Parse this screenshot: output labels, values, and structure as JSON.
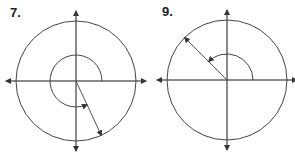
{
  "problems": [
    {
      "label": "7.",
      "terminal_angle_deg": -65,
      "rotation": "counterclockwise",
      "rotation_deg": 295
    },
    {
      "label": "9.",
      "terminal_angle_deg": 135,
      "rotation": "counterclockwise",
      "rotation_deg": 135
    }
  ],
  "colors": {
    "stroke": "#444444",
    "ray": "#555555"
  }
}
